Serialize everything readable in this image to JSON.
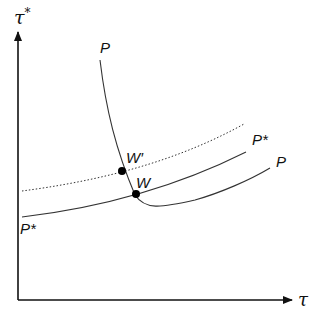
{
  "diagram": {
    "type": "economics-curve-diagram",
    "axes": {
      "x_label": "τ",
      "y_label": "τ*"
    },
    "curves": [
      {
        "id": "P",
        "label_top": "P",
        "label_right": "P",
        "style": "solid",
        "description": "steep downward curve flattening then rising to the right"
      },
      {
        "id": "P_star",
        "label_left": "P*",
        "label_right": "P*",
        "style": "solid",
        "description": "gently upward-sloping curve"
      },
      {
        "id": "P_star_shifted",
        "style": "dotted",
        "description": "upward-shifted P* curve"
      }
    ],
    "points": [
      {
        "id": "W",
        "label": "W"
      },
      {
        "id": "W_prime",
        "label": "W′"
      }
    ]
  },
  "labels": {
    "y_axis": "τ",
    "y_axis_sup": "*",
    "x_axis": "τ",
    "P_top": "P",
    "P_right": "P",
    "Pstar_right": "P*",
    "Pstar_left": "P*",
    "W": "W",
    "W_prime": "W′"
  }
}
